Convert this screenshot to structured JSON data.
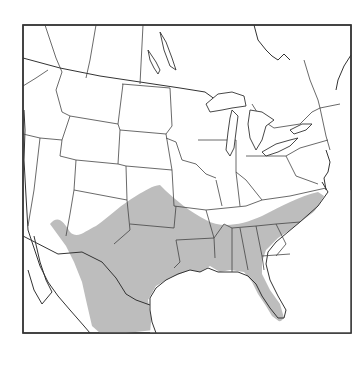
{
  "map": {
    "title": "",
    "subject": "species range map",
    "region": "North America (contiguous United States, southern Canada, northern Mexico)",
    "range_fill_color": "#bdbdbd",
    "border_color": "#444444",
    "background_color": "#ffffff",
    "range_description": "Southeastern and south-central United States and northern Mexico: Florida, Georgia, South Carolina, Alabama, Mississippi, Louisiana, Arkansas, Tennessee (south), Texas, Oklahoma, Kansas, southern Missouri, New Mexico, eastern Arizona, Colorado (southeast), extending into northeastern and central Mexico"
  }
}
